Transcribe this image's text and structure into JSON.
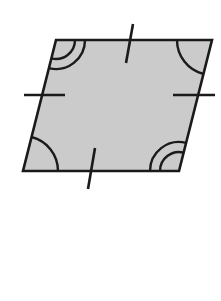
{
  "figure": {
    "shape": "parallelogram",
    "vertices": {
      "top_left": [
        56,
        40
      ],
      "top_right": [
        212,
        40
      ],
      "bottom_right": [
        179,
        171
      ],
      "bottom_left": [
        23,
        171
      ]
    },
    "fill_color": "#cbcbcb",
    "stroke_color": "#1a1a1a",
    "side_ticks": {
      "top": {
        "count": 1
      },
      "bottom": {
        "count": 1
      },
      "left": {
        "count": 1
      },
      "right": {
        "count": 1
      }
    },
    "angle_marks": {
      "top_left": {
        "arcs": 2
      },
      "top_right": {
        "arcs": 1
      },
      "bottom_right": {
        "arcs": 2
      },
      "bottom_left": {
        "arcs": 1
      }
    }
  }
}
